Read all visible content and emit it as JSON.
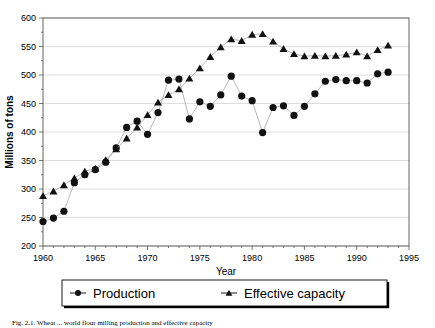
{
  "figure": {
    "caption": "Fig. 2.1.  Wheat ... world flour milling production and effective capacity"
  },
  "chart_data": {
    "type": "line",
    "title": "",
    "subtitle": "",
    "xlabel": "Year",
    "ylabel": "Millions of tons",
    "xlim": [
      1960,
      1995
    ],
    "ylim": [
      200,
      600
    ],
    "xticks": [
      1960,
      1965,
      1970,
      1975,
      1980,
      1985,
      1990,
      1995
    ],
    "yticks": [
      200,
      250,
      300,
      350,
      400,
      450,
      500,
      550,
      600
    ],
    "xtick_labels": [
      "1960",
      "1965",
      "1970",
      "1975",
      "1980",
      "1985",
      "1990",
      "1995"
    ],
    "ytick_labels": [
      "200",
      "250",
      "300",
      "350",
      "400",
      "450",
      "500",
      "550",
      "600"
    ],
    "grid": true,
    "grid_axis": "y",
    "legend_position": "bottom",
    "x": [
      1960,
      1961,
      1962,
      1963,
      1964,
      1965,
      1966,
      1967,
      1968,
      1969,
      1970,
      1971,
      1972,
      1973,
      1974,
      1975,
      1976,
      1977,
      1978,
      1979,
      1980,
      1981,
      1982,
      1983,
      1984,
      1985,
      1986,
      1987,
      1988,
      1989,
      1990,
      1991,
      1992,
      1993
    ],
    "series": [
      {
        "name": "Production",
        "marker": "circle",
        "color": "#111111",
        "values": [
          243,
          249,
          261,
          311,
          325,
          334,
          347,
          372,
          408,
          419,
          396,
          434,
          491,
          493,
          423,
          453,
          445,
          465,
          498,
          463,
          455,
          399,
          443,
          446,
          429,
          445,
          467,
          489,
          492,
          490,
          490,
          486,
          502,
          505
        ]
      },
      {
        "name": "Effective capacity",
        "marker": "triangle",
        "color": "#111111",
        "values": [
          288,
          296,
          307,
          319,
          331,
          336,
          351,
          370,
          389,
          408,
          430,
          452,
          465,
          475,
          494,
          512,
          532,
          549,
          563,
          560,
          571,
          572,
          559,
          546,
          537,
          533,
          534,
          533,
          534,
          536,
          540,
          533,
          544,
          552
        ]
      }
    ],
    "legend": [
      "Production",
      "Effective capacity"
    ]
  }
}
